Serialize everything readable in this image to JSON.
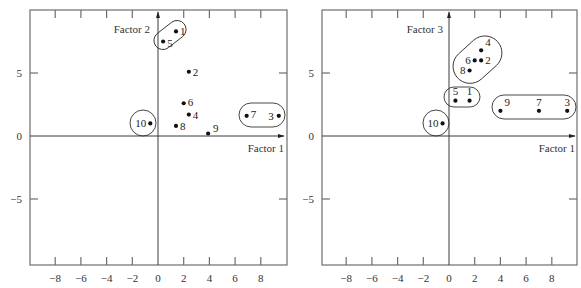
{
  "chart_data": [
    {
      "type": "scatter",
      "title": "",
      "xlabel": "Factor 1",
      "ylabel": "Factor 2",
      "xlim": [
        -9.9,
        10
      ],
      "ylim": [
        -10,
        10
      ],
      "x_ticks": [
        -8,
        -6,
        -4,
        -2,
        0,
        2,
        4,
        6,
        8
      ],
      "x_tick_labels": [
        "−8",
        "−6",
        "−4",
        "−2",
        "0",
        "2",
        "4",
        "6",
        "8"
      ],
      "y_ticks": [
        -5,
        0,
        5
      ],
      "y_tick_labels": [
        "−5",
        "0",
        "5"
      ],
      "grid": false,
      "points": [
        {
          "label": "1",
          "x": 1.4,
          "y": 8.3
        },
        {
          "label": "2",
          "x": 2.4,
          "y": 5.1
        },
        {
          "label": "3",
          "x": 9.4,
          "y": 1.6
        },
        {
          "label": "4",
          "x": 2.4,
          "y": 1.7
        },
        {
          "label": "5",
          "x": 0.4,
          "y": 7.5
        },
        {
          "label": "6",
          "x": 2.0,
          "y": 2.6
        },
        {
          "label": "7",
          "x": 6.9,
          "y": 1.6
        },
        {
          "label": "8",
          "x": 1.4,
          "y": 0.8
        },
        {
          "label": "9",
          "x": 3.9,
          "y": 0.2
        },
        {
          "label": "10",
          "x": -0.6,
          "y": 1.0
        }
      ],
      "clusters": [
        [
          "1",
          "5"
        ],
        [
          "7",
          "3"
        ],
        [
          "10"
        ]
      ]
    },
    {
      "type": "scatter",
      "title": "",
      "xlabel": "Factor 1",
      "ylabel": "Factor 3",
      "xlim": [
        -9.9,
        10
      ],
      "ylim": [
        -10,
        10
      ],
      "x_ticks": [
        -8,
        -6,
        -4,
        -2,
        0,
        2,
        4,
        6,
        8
      ],
      "x_tick_labels": [
        "−8",
        "−6",
        "−4",
        "−2",
        "0",
        "2",
        "4",
        "6",
        "8"
      ],
      "y_ticks": [
        -5,
        0,
        5
      ],
      "y_tick_labels": [
        "−5",
        "0",
        "5"
      ],
      "grid": false,
      "points": [
        {
          "label": "1",
          "x": 1.6,
          "y": 2.8
        },
        {
          "label": "2",
          "x": 2.5,
          "y": 6.0
        },
        {
          "label": "3",
          "x": 9.2,
          "y": 2.0
        },
        {
          "label": "4",
          "x": 2.5,
          "y": 6.8
        },
        {
          "label": "5",
          "x": 0.5,
          "y": 2.8
        },
        {
          "label": "6",
          "x": 2.0,
          "y": 6.0
        },
        {
          "label": "7",
          "x": 7.0,
          "y": 2.0
        },
        {
          "label": "8",
          "x": 1.6,
          "y": 5.2
        },
        {
          "label": "9",
          "x": 4.0,
          "y": 2.0
        },
        {
          "label": "10",
          "x": -0.5,
          "y": 1.0
        }
      ],
      "clusters": [
        [
          "4",
          "6",
          "2",
          "8"
        ],
        [
          "5",
          "1"
        ],
        [
          "9",
          "7",
          "3"
        ],
        [
          "10"
        ]
      ]
    }
  ],
  "panels": [
    {
      "y_axis_label": "Factor 2",
      "x_axis_label": "Factor 1"
    },
    {
      "y_axis_label": "Factor 3",
      "x_axis_label": "Factor 1"
    }
  ]
}
